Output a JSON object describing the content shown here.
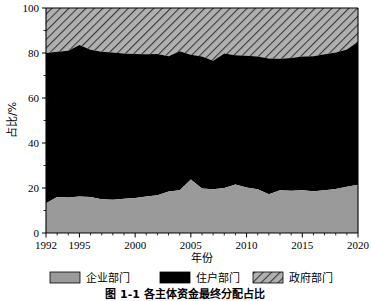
{
  "chart_data": {
    "type": "area",
    "stacked": true,
    "title": "",
    "xlabel": "年份",
    "ylabel": "占比/%",
    "xlim": [
      1992,
      2020
    ],
    "ylim": [
      0,
      100
    ],
    "grid": false,
    "legend_position": "bottom",
    "x_ticks": [
      1992,
      1995,
      2000,
      2005,
      2010,
      2015,
      2020
    ],
    "x_minor_tick_step": 1,
    "y_ticks": [
      0,
      20,
      40,
      60,
      80,
      100
    ],
    "x": [
      1992,
      1993,
      1994,
      1995,
      1996,
      1997,
      1998,
      1999,
      2000,
      2001,
      2002,
      2003,
      2004,
      2005,
      2006,
      2007,
      2008,
      2009,
      2010,
      2011,
      2012,
      2013,
      2014,
      2015,
      2016,
      2017,
      2018,
      2019,
      2020
    ],
    "series": [
      {
        "name": "企业部门",
        "color": "#9a9a9a",
        "pattern": "solid",
        "values": [
          13.2,
          16.0,
          15.8,
          16.2,
          16.0,
          15.0,
          14.8,
          15.2,
          15.6,
          16.2,
          16.8,
          18.4,
          19.0,
          23.8,
          19.8,
          19.4,
          20.0,
          21.6,
          20.2,
          19.4,
          17.2,
          19.0,
          18.8,
          19.0,
          18.6,
          19.0,
          19.6,
          20.6,
          21.4
        ]
      },
      {
        "name": "住户部门",
        "color": "#000000",
        "pattern": "solid",
        "values": [
          66.8,
          64.6,
          65.2,
          67.4,
          65.4,
          65.6,
          65.4,
          64.6,
          64.0,
          63.2,
          62.8,
          60.2,
          61.8,
          55.4,
          58.6,
          57.2,
          59.8,
          57.4,
          58.6,
          59.0,
          60.4,
          58.4,
          59.0,
          59.4,
          60.0,
          60.4,
          60.6,
          61.0,
          63.6
        ]
      },
      {
        "name": "政府部门",
        "color": "#a0a0a0",
        "pattern": "diagonal-hatch",
        "values": [
          20.0,
          19.4,
          19.0,
          16.4,
          18.6,
          19.4,
          19.8,
          20.2,
          20.4,
          20.6,
          20.4,
          21.4,
          19.2,
          20.8,
          21.6,
          23.4,
          20.2,
          21.0,
          21.2,
          21.6,
          22.4,
          22.6,
          22.2,
          21.6,
          21.4,
          20.6,
          19.8,
          18.4,
          15.0
        ]
      }
    ],
    "cumulative_upper_corporate": [
      13.2,
      16.0,
      15.8,
      16.2,
      16.0,
      15.0,
      14.8,
      15.2,
      15.6,
      16.2,
      16.8,
      18.4,
      19.0,
      23.8,
      19.8,
      19.4,
      20.0,
      21.6,
      20.2,
      19.4,
      17.2,
      19.0,
      18.8,
      19.0,
      18.6,
      19.0,
      19.6,
      20.6,
      21.4
    ],
    "cumulative_upper_household": [
      80.0,
      80.6,
      81.0,
      83.6,
      81.4,
      80.6,
      80.2,
      79.8,
      79.6,
      79.4,
      79.6,
      78.6,
      80.8,
      79.2,
      78.4,
      76.6,
      79.8,
      79.0,
      78.8,
      78.4,
      77.6,
      77.4,
      77.8,
      78.4,
      78.6,
      79.4,
      80.2,
      81.6,
      85.0
    ]
  },
  "axes": {
    "y_label": "占比/%",
    "x_label": "年份",
    "y_tick_labels": [
      "0",
      "20",
      "40",
      "60",
      "80",
      "100"
    ],
    "x_tick_labels": [
      "1992",
      "1995",
      "2000",
      "2005",
      "2010",
      "2015",
      "2020"
    ]
  },
  "legend": {
    "items": [
      {
        "label": "企业部门",
        "swatch": "solid-gray"
      },
      {
        "label": "住户部门",
        "swatch": "solid-black"
      },
      {
        "label": "政府部门",
        "swatch": "hatched-gray"
      }
    ]
  },
  "caption": {
    "text": "图 1-1  各主体资金最终分配占比"
  }
}
